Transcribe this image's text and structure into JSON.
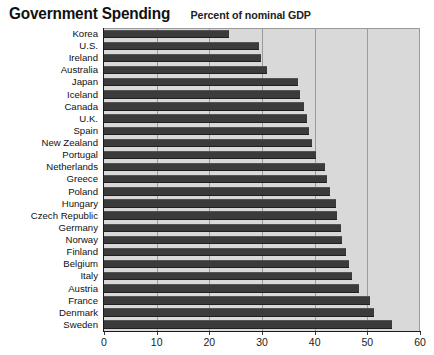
{
  "header": {
    "title": "Government Spending",
    "subtitle": "Percent of nominal GDP"
  },
  "chart_data": {
    "type": "bar",
    "orientation": "horizontal",
    "title": "Government Spending",
    "subtitle": "Percent of nominal GDP",
    "xlabel": "",
    "ylabel": "",
    "xlim": [
      0,
      60
    ],
    "xticks": [
      0,
      10,
      20,
      30,
      40,
      50,
      60
    ],
    "xticklabels": [
      "0",
      "10",
      "20",
      "30",
      "40",
      "50",
      "60"
    ],
    "grid": true,
    "legend": false,
    "bar_color": "#3b3b3b",
    "plot_background": "#d9d9d9",
    "categories": [
      "Korea",
      "U.S.",
      "Ireland",
      "Australia",
      "Japan",
      "Iceland",
      "Canada",
      "U.K.",
      "Spain",
      "New Zealand",
      "Portugal",
      "Netherlands",
      "Greece",
      "Poland",
      "Hungary",
      "Czech Republic",
      "Germany",
      "Norway",
      "Finland",
      "Belgium",
      "Italy",
      "Austria",
      "France",
      "Denmark",
      "Sweden"
    ],
    "values": [
      23.8,
      29.5,
      29.8,
      31.0,
      36.9,
      37.3,
      38.0,
      38.5,
      38.9,
      39.4,
      40.2,
      42.0,
      42.3,
      43.0,
      44.1,
      44.3,
      45.0,
      45.2,
      46.0,
      46.5,
      47.0,
      48.5,
      50.5,
      51.3,
      54.7
    ]
  }
}
